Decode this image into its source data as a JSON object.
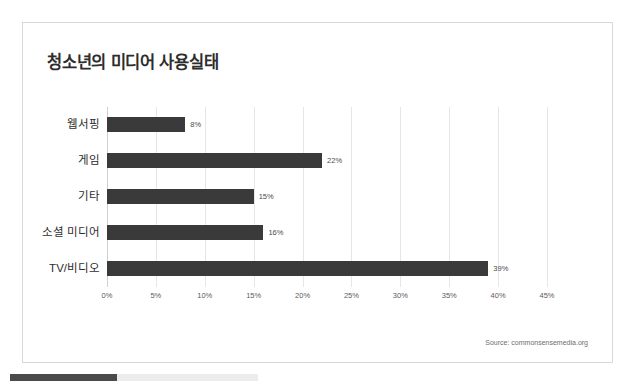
{
  "chart_data": {
    "type": "bar",
    "orientation": "horizontal",
    "title": "청소년의 미디어 사용실태",
    "xlabel": "",
    "ylabel": "",
    "categories": [
      "웹서핑",
      "게임",
      "기타",
      "소셜 미디어",
      "TV/비디오"
    ],
    "values": [
      8,
      22,
      15,
      16,
      39
    ],
    "value_labels": [
      "8%",
      "22%",
      "15%",
      "16%",
      "39%"
    ],
    "xlim": [
      0,
      45
    ],
    "xticks": [
      0,
      5,
      10,
      15,
      20,
      25,
      30,
      35,
      40,
      45
    ],
    "xticklabels": [
      "0%",
      "5%",
      "10%",
      "15%",
      "20%",
      "25%",
      "30%",
      "35%",
      "40%",
      "45%"
    ],
    "grid": true,
    "legend": null,
    "series": [
      {
        "name": "사용 비율",
        "values": [
          8,
          22,
          15,
          16,
          39
        ],
        "color": "#3a3a3a"
      }
    ],
    "source_note": "Source: commonsensemedia.org"
  },
  "colors": {
    "bar": "#3a3a3a",
    "grid": "#e6e6e6",
    "text": "#2d2d2d",
    "muted_text": "#5a5a5a",
    "card_border": "#d8d8d8",
    "page_background": "#ffffff",
    "scrollbar_thumb": "#4a4a4a",
    "scrollbar_track": "#ececec"
  }
}
